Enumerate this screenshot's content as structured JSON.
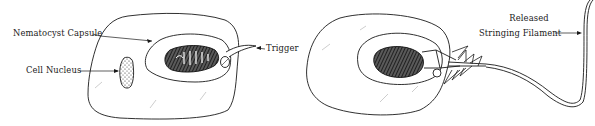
{
  "diagram": {
    "panels": [
      {
        "id": "resting",
        "labels": {
          "capsule": "Nematocyst Capsule",
          "nucleus": "Cell Nucleus",
          "trigger": "Trigger"
        }
      },
      {
        "id": "discharged",
        "labels": {
          "filament_line1": "Released",
          "filament_line2": "Stringing Filament"
        }
      }
    ],
    "colors": {
      "ink": "#1a1a1a",
      "background": "#ffffff",
      "shading": "#2b2b2b"
    }
  }
}
